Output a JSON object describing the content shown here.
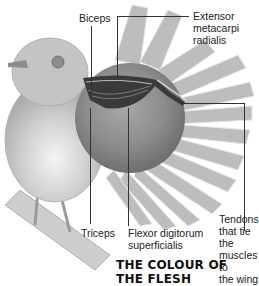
{
  "diagram": {
    "title": "THE COLOUR OF THE FLESH",
    "labels": {
      "biceps": "Biceps",
      "extensor_line1": "Extensor",
      "extensor_line2": "metacarpi",
      "extensor_line3": "radialis",
      "triceps": "Triceps",
      "flexor_line1": "Flexor digitorum",
      "flexor_line2": "superficialis",
      "tendons_line1": "Tendons",
      "tendons_line2": "that tie the",
      "tendons_line3": "muscles to",
      "tendons_line4": "the wing"
    },
    "colors": {
      "background": "#ffffff",
      "bird": "#c8c8c8",
      "wing_feathers": "#b5b5b5",
      "magnifier_circle": "#8a8a8a",
      "muscle": "#333333",
      "leader_lines": "#333333",
      "text": "#222222"
    }
  }
}
